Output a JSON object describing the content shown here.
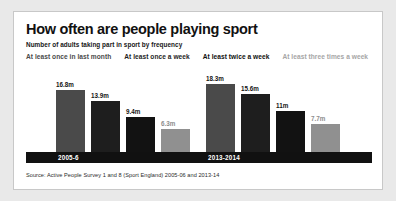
{
  "header": {
    "title": "How often are people playing sport",
    "subtitle": "Number of adults taking part in sport by frequency"
  },
  "source": "Source: Active People Survey 1 and 8 (Sport England) 2005-06 and 2013-14",
  "colors": {
    "series_0": "#4a4a4a",
    "series_1": "#1e1e1e",
    "series_2": "#121212",
    "series_3": "#909090",
    "axis_band": "#111111",
    "card_background": "#ffffff",
    "page_background": "#e9e9e9",
    "card_border": "#c8c8c8"
  },
  "chart_data": {
    "type": "bar",
    "title": "How often are people playing sport",
    "subtitle": "Number of adults taking part in sport by frequency",
    "xlabel": "",
    "ylabel": "",
    "unit": "m",
    "ylim": [
      0,
      20
    ],
    "grid": false,
    "legend_position": "top",
    "categories": [
      "2005-6",
      "2013-2014"
    ],
    "series": [
      {
        "name": "At least once in last month",
        "color": "#4a4a4a",
        "values": [
          16.8,
          18.3
        ],
        "labels": [
          "16.8m",
          "18.3m"
        ]
      },
      {
        "name": "At least once a week",
        "color": "#1e1e1e",
        "values": [
          13.9,
          15.6
        ],
        "labels": [
          "13.9m",
          "15.6m"
        ]
      },
      {
        "name": "At least twice a week",
        "color": "#121212",
        "values": [
          9.4,
          11
        ],
        "labels": [
          "9.4m",
          "11m"
        ]
      },
      {
        "name": "At least three times a week",
        "color": "#909090",
        "values": [
          6.3,
          7.7
        ],
        "labels": [
          "6.3m",
          "7.7m"
        ]
      }
    ]
  }
}
